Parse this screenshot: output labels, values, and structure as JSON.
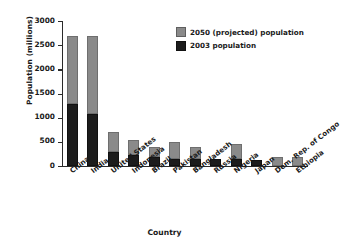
{
  "chart_data": {
    "type": "bar",
    "subtype": "stacked",
    "title": "",
    "xlabel": "Country",
    "ylabel": "Population (millions)",
    "ylim": [
      0,
      3000
    ],
    "yticks": [
      0,
      500,
      1000,
      1500,
      2000,
      2500,
      3000
    ],
    "ytick_labels": [
      "0",
      "500",
      "1000",
      "1500",
      "2000",
      "2500",
      "3000"
    ],
    "grid": false,
    "legend_position": "upper right",
    "categories": [
      "China",
      "India",
      "United States",
      "Indonesia",
      "Brazil",
      "Pakistan",
      "Bangladesh",
      "Russia",
      "Nigeria",
      "Japan",
      "Dem. Rep. of Congo",
      "Ethiopia"
    ],
    "series": [
      {
        "name": "2003 population",
        "color": "#1c1c1c",
        "values": [
          1290,
          1070,
          300,
          220,
          180,
          150,
          150,
          145,
          135,
          128,
          0,
          0
        ]
      },
      {
        "name": "2050 (projected) population",
        "color": "#8a8a8a",
        "values": [
          2680,
          2700,
          710,
          530,
          400,
          500,
          400,
          145,
          450,
          128,
          185,
          185
        ]
      }
    ],
    "legend": [
      "2050 (projected) population",
      "2003 population"
    ]
  },
  "colors": {
    "projected_2050": "#8a8a8a",
    "population_2003": "#1c1c1c",
    "axis": "#2b2b2b",
    "text": "#1a1a1a",
    "background": "#ffffff"
  }
}
